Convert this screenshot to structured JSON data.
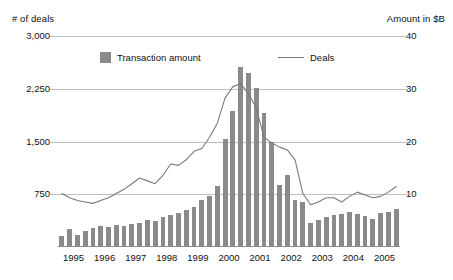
{
  "left_axis_title": "# of deals",
  "right_axis_title": "Amount in $B",
  "legend": {
    "bars_label": "Transaction amount",
    "line_label": "Deals",
    "bar_color": "#8a8a8a",
    "line_color": "#7a7a7a"
  },
  "chart_data": {
    "type": "bar",
    "title": "",
    "subtitle": "",
    "xlabel": "",
    "ylabel": "# of deals",
    "y2label": "Amount in $B",
    "grid": true,
    "legend_position": "top-inside",
    "categories": [
      "1995 Q1",
      "1995 Q2",
      "1995 Q3",
      "1995 Q4",
      "1996 Q1",
      "1996 Q2",
      "1996 Q3",
      "1996 Q4",
      "1997 Q1",
      "1997 Q2",
      "1997 Q3",
      "1997 Q4",
      "1998 Q1",
      "1998 Q2",
      "1998 Q3",
      "1998 Q4",
      "1999 Q1",
      "1999 Q2",
      "1999 Q3",
      "1999 Q4",
      "2000 Q1",
      "2000 Q2",
      "2000 Q3",
      "2000 Q4",
      "2001 Q1",
      "2001 Q2",
      "2001 Q3",
      "2001 Q4",
      "2002 Q1",
      "2002 Q2",
      "2002 Q3",
      "2002 Q4",
      "2003 Q1",
      "2003 Q2",
      "2003 Q3",
      "2003 Q4",
      "2004 Q1",
      "2004 Q2",
      "2004 Q3",
      "2004 Q4",
      "2005 Q1",
      "2005 Q2",
      "2005 Q3",
      "2005 Q4"
    ],
    "x_tick_labels": [
      "1995",
      "1996",
      "1997",
      "1998",
      "1999",
      "2000",
      "2001",
      "2002",
      "2003",
      "2004",
      "2005"
    ],
    "y_tick_labels": [
      "750",
      "1,500",
      "2,250",
      "3,000"
    ],
    "y_ticks": [
      750,
      1500,
      2250,
      3000
    ],
    "ylim": [
      0,
      3000
    ],
    "y2_tick_labels": [
      "10",
      "20",
      "30",
      "40"
    ],
    "y2_ticks": [
      10,
      20,
      30,
      40
    ],
    "y2lim": [
      0,
      40
    ],
    "series": [
      {
        "name": "Transaction amount",
        "unit": "$B",
        "axis": "right",
        "kind": "bar",
        "values": [
          2.0,
          3.4,
          2.2,
          3.0,
          3.6,
          4.0,
          3.8,
          4.2,
          4.0,
          4.4,
          4.6,
          5.2,
          5.0,
          5.6,
          6.0,
          6.4,
          7.0,
          7.6,
          9.0,
          9.6,
          11.6,
          20.4,
          25.8,
          34.2,
          33.0,
          30.2,
          25.4,
          20.0,
          11.8,
          13.6,
          9.0,
          8.6,
          4.6,
          5.2,
          5.6,
          6.0,
          6.2,
          6.6,
          6.2,
          5.8,
          5.4,
          6.4,
          6.6,
          7.2
        ]
      },
      {
        "name": "Deals",
        "unit": "deals",
        "axis": "left",
        "kind": "line",
        "values": [
          760,
          700,
          660,
          640,
          620,
          660,
          700,
          760,
          820,
          900,
          980,
          940,
          900,
          1020,
          1180,
          1160,
          1240,
          1360,
          1400,
          1560,
          1760,
          2120,
          2280,
          2320,
          2180,
          1980,
          1560,
          1480,
          1420,
          1380,
          1240,
          760,
          600,
          640,
          700,
          700,
          640,
          720,
          780,
          740,
          700,
          720,
          780,
          860
        ]
      }
    ]
  }
}
